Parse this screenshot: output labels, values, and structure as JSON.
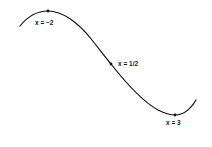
{
  "diagram": {
    "stroke_color": "#111111",
    "points": [
      {
        "id": "local-max",
        "label": "x = −2",
        "cx": 48,
        "cy": 11
      },
      {
        "id": "inflection",
        "label": "x = 1/2",
        "cx": 111,
        "cy": 64
      },
      {
        "id": "local-min",
        "label": "x = 3",
        "cx": 175,
        "cy": 115
      }
    ]
  },
  "labels": {
    "max": "x = −2",
    "inflection": "x = 1/2",
    "min": "x = 3"
  }
}
